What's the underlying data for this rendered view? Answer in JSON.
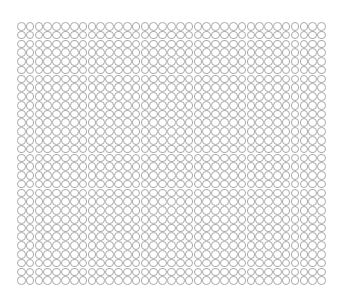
{
  "grid": {
    "columns": 35,
    "rows": 30,
    "pitch_x": 8.83,
    "pitch_y": 8.77,
    "shape": "circle-outline-icon",
    "stroke_color": "#a9a9a9",
    "background": "#ffffff"
  }
}
